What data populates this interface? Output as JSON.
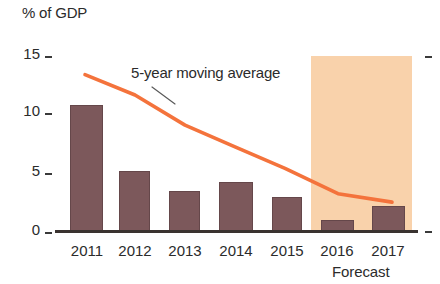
{
  "chart_data": {
    "type": "bar",
    "title": "% of GDP",
    "xlabel": "",
    "ylabel": "% of GDP",
    "categories": [
      "2011",
      "2012",
      "2013",
      "2014",
      "2015",
      "2016",
      "2017"
    ],
    "values": [
      10.5,
      5.0,
      3.3,
      4.1,
      2.8,
      0.9,
      2.1
    ],
    "ylim": [
      0,
      15
    ],
    "yticks": [
      0,
      5,
      10,
      15
    ],
    "ytick_labels": [
      "0",
      "5",
      "10",
      "15"
    ],
    "grid": false,
    "legend": "none",
    "series": [
      {
        "name": "% of GDP",
        "type": "bar",
        "values": [
          10.5,
          5.0,
          3.3,
          4.1,
          2.8,
          0.9,
          2.1
        ],
        "color": "#7c585b"
      },
      {
        "name": "5-year moving average",
        "type": "line",
        "values": [
          13.0,
          11.3,
          8.8,
          7.0,
          5.2,
          3.1,
          2.4
        ],
        "color": "#f4733c"
      }
    ],
    "annotations": [
      {
        "text": "5-year moving average",
        "target_series": "5-year moving average"
      },
      {
        "text": "Forecast",
        "covers_categories": [
          "2016",
          "2017"
        ],
        "shading_color": "#f9d2ab"
      }
    ],
    "colors": {
      "bar": "#7c585b",
      "line": "#f4733c",
      "forecast_band": "#f9d2ab",
      "axis": "#3a3330",
      "text": "#2b2b2b",
      "background": "#ffffff"
    }
  },
  "axis": {
    "title": "% of GDP",
    "y_ticks": [
      "15",
      "10",
      "5",
      "0"
    ]
  },
  "x_labels": [
    "2011",
    "2012",
    "2013",
    "2014",
    "2015",
    "2016",
    "2017"
  ],
  "annotation": {
    "moving_average": "5-year moving average",
    "forecast": "Forecast"
  }
}
